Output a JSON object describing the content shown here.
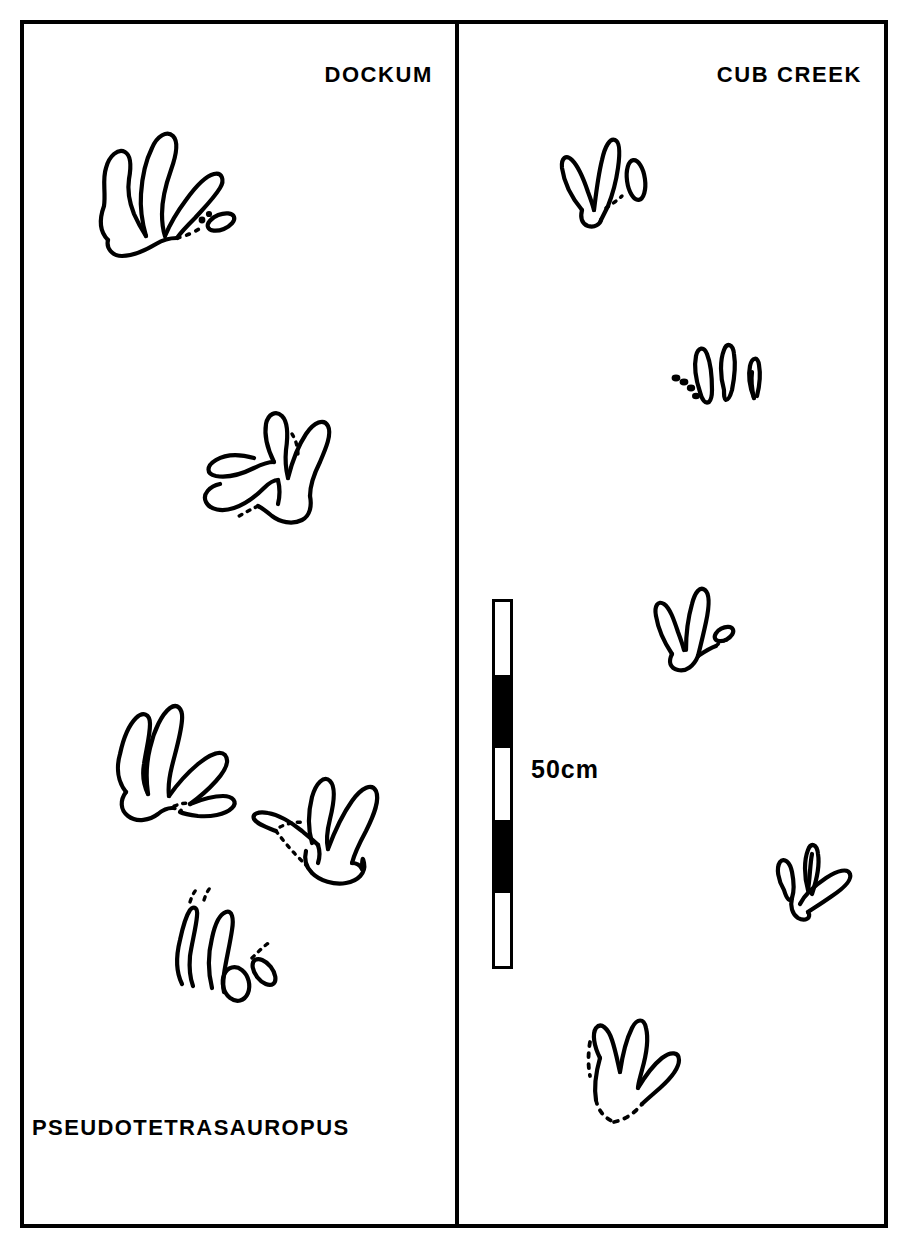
{
  "figure": {
    "taxon_label": "PSEUDOTETRASAUROPUS",
    "kind": "comparative-trackway-plate"
  },
  "panels": [
    {
      "id": "dockum",
      "title": "DOCKUM",
      "track_count": 5,
      "tracks": [
        {
          "name": "dockum-track-1",
          "description": "four-digit pes print with heel pad and small lateral digit"
        },
        {
          "name": "dockum-track-2",
          "description": "four-digit print, digits splayed, partial dashed outline"
        },
        {
          "name": "dockum-track-3",
          "description": "four-digit print with elongate digits and rounded heel"
        },
        {
          "name": "dockum-track-4",
          "description": "four-digit print with circular heel pad"
        },
        {
          "name": "dockum-track-5",
          "description": "incomplete print, digit impressions only"
        }
      ]
    },
    {
      "id": "cub-creek",
      "title": "CUB CREEK",
      "track_count": 5,
      "tracks": [
        {
          "name": "cubcreek-track-1",
          "description": "narrow two-digit print with isolated lateral digit pad"
        },
        {
          "name": "cubcreek-track-2",
          "description": "three separate digit impressions with dashed partial"
        },
        {
          "name": "cubcreek-track-3",
          "description": "two long digits with small lateral pad"
        },
        {
          "name": "cubcreek-track-4",
          "description": "small print, three short digits"
        },
        {
          "name": "cubcreek-track-5",
          "description": "broad four-digit print with dashed posterior margin"
        }
      ]
    }
  ],
  "scale_bar": {
    "label": "50cm",
    "total_length_cm": 50,
    "segment_count": 5,
    "segment_length_cm": 10,
    "segments": [
      "light",
      "dark",
      "light",
      "dark",
      "light"
    ],
    "orientation": "vertical"
  },
  "colors": {
    "ink": "#000000",
    "paper": "#ffffff"
  }
}
